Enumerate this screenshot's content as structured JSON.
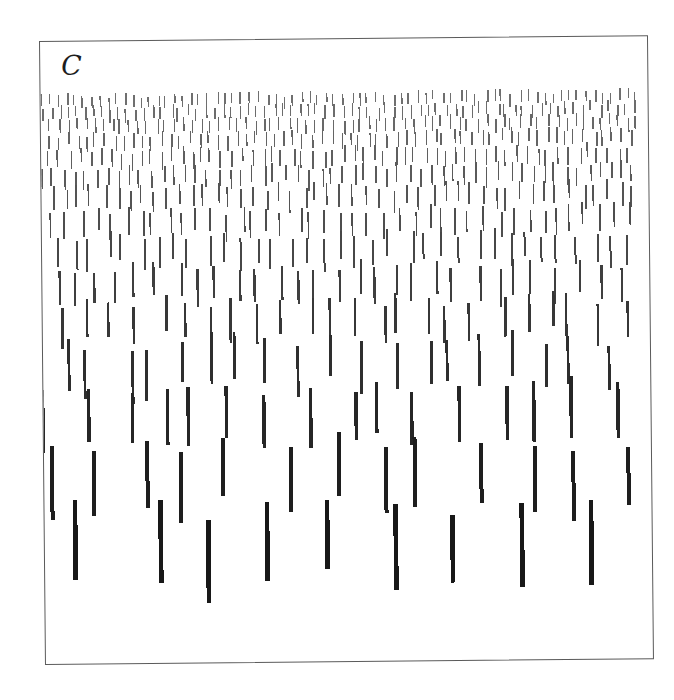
{
  "figure": {
    "panel_label": "C",
    "background_color": "#ffffff",
    "frame_color": "#5a5a5a",
    "frame": {
      "x": 39,
      "y": 41,
      "width": 609,
      "height": 624
    },
    "mark_color_top": "#6e6e6e",
    "mark_color_bottom": "#161616"
  },
  "chart_data": {
    "type": "scatter",
    "title": "C",
    "xlabel": "",
    "ylabel": "",
    "xlim": [
      0,
      607
    ],
    "ylim": [
      0,
      622
    ],
    "grid": false,
    "legend": null,
    "rows": [
      {
        "row": 1,
        "y": 54,
        "mark_length": 11,
        "stroke_width": 1.3,
        "color": "#6f6f6f",
        "spacing_x": 8.4,
        "count": 72,
        "jitter_y": 3
      },
      {
        "row": 2,
        "y": 66,
        "mark_length": 12,
        "stroke_width": 1.3,
        "color": "#6c6c6c",
        "spacing_x": 8.6,
        "count": 70,
        "jitter_y": 3
      },
      {
        "row": 3,
        "y": 79,
        "mark_length": 13,
        "stroke_width": 1.4,
        "color": "#686868",
        "spacing_x": 8.9,
        "count": 68,
        "jitter_y": 3
      },
      {
        "row": 4,
        "y": 93,
        "mark_length": 14,
        "stroke_width": 1.4,
        "color": "#646464",
        "spacing_x": 9.4,
        "count": 64,
        "jitter_y": 3
      },
      {
        "row": 5,
        "y": 109,
        "mark_length": 16,
        "stroke_width": 1.5,
        "color": "#5f5f5f",
        "spacing_x": 10.2,
        "count": 59,
        "jitter_y": 4
      },
      {
        "row": 6,
        "y": 127,
        "mark_length": 18,
        "stroke_width": 1.6,
        "color": "#5a5a5a",
        "spacing_x": 11.2,
        "count": 54,
        "jitter_y": 4
      },
      {
        "row": 7,
        "y": 147,
        "mark_length": 21,
        "stroke_width": 1.7,
        "color": "#545454",
        "spacing_x": 12.6,
        "count": 48,
        "jitter_y": 5
      },
      {
        "row": 8,
        "y": 170,
        "mark_length": 24,
        "stroke_width": 1.8,
        "color": "#4e4e4e",
        "spacing_x": 14.4,
        "count": 42,
        "jitter_y": 5
      },
      {
        "row": 9,
        "y": 196,
        "mark_length": 28,
        "stroke_width": 2.0,
        "color": "#474747",
        "spacing_x": 16.8,
        "count": 36,
        "jitter_y": 6
      },
      {
        "row": 10,
        "y": 226,
        "mark_length": 33,
        "stroke_width": 2.2,
        "color": "#3f3f3f",
        "spacing_x": 20.0,
        "count": 30,
        "jitter_y": 7
      },
      {
        "row": 11,
        "y": 261,
        "mark_length": 39,
        "stroke_width": 2.5,
        "color": "#373737",
        "spacing_x": 24.3,
        "count": 25,
        "jitter_y": 8
      },
      {
        "row": 12,
        "y": 301,
        "mark_length": 46,
        "stroke_width": 2.9,
        "color": "#2e2e2e",
        "spacing_x": 30.0,
        "count": 20,
        "jitter_y": 9
      },
      {
        "row": 13,
        "y": 348,
        "mark_length": 55,
        "stroke_width": 3.4,
        "color": "#262626",
        "spacing_x": 37.5,
        "count": 16,
        "jitter_y": 10
      },
      {
        "row": 14,
        "y": 404,
        "mark_length": 66,
        "stroke_width": 4.0,
        "color": "#1e1e1e",
        "spacing_x": 48.0,
        "count": 13,
        "jitter_y": 11
      },
      {
        "row": 15,
        "y": 470,
        "mark_length": 78,
        "stroke_width": 4.7,
        "color": "#181818",
        "spacing_x": 63.0,
        "count": 10,
        "jitter_y": 12
      }
    ]
  }
}
